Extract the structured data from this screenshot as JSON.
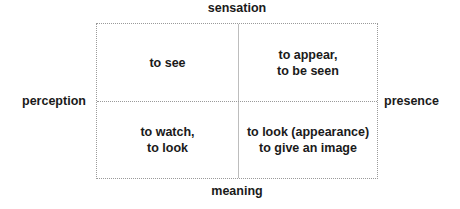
{
  "axes": {
    "top": "sensation",
    "bottom": "meaning",
    "left": "perception",
    "right": "presence"
  },
  "quadrants": {
    "top_left": "to see",
    "top_right": "to appear,\nto be seen",
    "bottom_left": "to watch,\nto look",
    "bottom_right": "to look (appearance)\nto give an image"
  },
  "colors": {
    "text": "#1a1a1a",
    "border": "#9a9a9a",
    "background": "#ffffff"
  }
}
